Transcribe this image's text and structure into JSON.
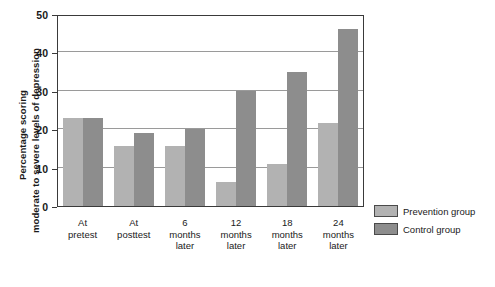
{
  "chart_data": {
    "type": "bar",
    "title": "",
    "xlabel": "",
    "ylabel_line1": "Percentage scoring",
    "ylabel_line2": "moderate to severe levels of depression",
    "categories": [
      "At\npretest",
      "At\nposttest",
      "6\nmonths\nlater",
      "12\nmonths\nlater",
      "18\nmonths\nlater",
      "24\nmonths\nlater"
    ],
    "series": [
      {
        "name": "Prevention group",
        "color": "#b2b2b2",
        "values": [
          23,
          15.5,
          15.5,
          6.3,
          11,
          21.5
        ]
      },
      {
        "name": "Control group",
        "color": "#8d8d8d",
        "values": [
          23,
          19,
          20,
          30,
          35,
          46
        ]
      }
    ],
    "ylim": [
      0,
      50
    ],
    "yticks": [
      0,
      10,
      20,
      30,
      40,
      50
    ],
    "ytick_labels": [
      "0",
      "10",
      "20",
      "30",
      "40",
      "50"
    ],
    "gridlines": [
      10,
      20,
      30,
      40
    ],
    "grid": true,
    "legend_position": "right"
  },
  "legend": {
    "items": [
      {
        "label": "Prevention group",
        "color": "#b2b2b2"
      },
      {
        "label": "Control group",
        "color": "#8d8d8d"
      }
    ]
  }
}
